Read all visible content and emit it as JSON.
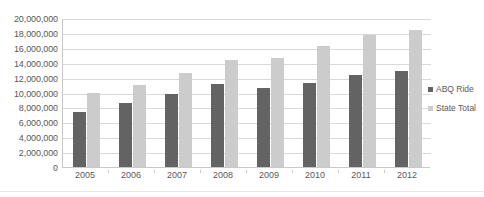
{
  "chart_data": {
    "type": "bar",
    "title": "",
    "xlabel": "",
    "ylabel": "",
    "categories": [
      "2005",
      "2006",
      "2007",
      "2008",
      "2009",
      "2010",
      "2011",
      "2012"
    ],
    "series": [
      {
        "name": "ABQ Ride",
        "color": "#636363",
        "values": [
          7400000,
          8600000,
          9800000,
          11100000,
          10600000,
          11300000,
          12400000,
          12900000
        ]
      },
      {
        "name": "State Total",
        "color": "#cccccc",
        "values": [
          10000000,
          11000000,
          12600000,
          14300000,
          14700000,
          16200000,
          17700000,
          18400000
        ]
      }
    ],
    "ylim": [
      0,
      20000000
    ],
    "ytick_values": [
      0,
      2000000,
      4000000,
      6000000,
      8000000,
      10000000,
      12000000,
      14000000,
      16000000,
      18000000,
      20000000
    ],
    "ytick_labels": [
      "0",
      "2,000,000",
      "4,000,000",
      "6,000,000",
      "8,000,000",
      "10,000,000",
      "12,000,000",
      "14,000,000",
      "16,000,000",
      "18,000,000",
      "20,000,000"
    ],
    "grid": true,
    "legend_position": "right"
  },
  "legend": {
    "items": [
      {
        "label": "ABQ Ride",
        "color": "#636363"
      },
      {
        "label": "State Total",
        "color": "#cccccc"
      }
    ]
  }
}
